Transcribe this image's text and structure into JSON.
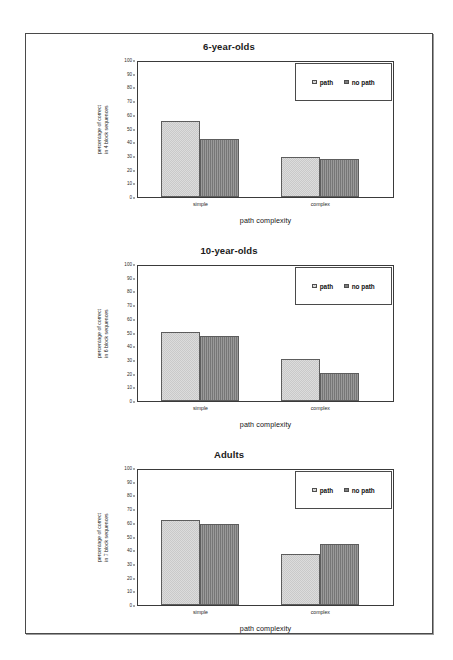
{
  "figure": {
    "panels": [
      {
        "title": "6-year-olds",
        "ylabel_line1": "percentage of correct",
        "ylabel_line2": "in 4 block sequences",
        "xlabel": "path complexity",
        "categories": [
          "simple",
          "complex"
        ],
        "yticks": [
          "0",
          "10",
          "20",
          "30",
          "40",
          "50",
          "60",
          "70",
          "80",
          "90",
          "100"
        ],
        "legend": [
          {
            "label": "path",
            "swatch": "light-checker-swatch",
            "color": "#dcdcdc"
          },
          {
            "label": "no path",
            "swatch": "dark-gray-swatch",
            "color": "#7d7d7d"
          }
        ],
        "series": [
          {
            "name": "path",
            "values": [
              56,
              30
            ]
          },
          {
            "name": "no path",
            "values": [
              43,
              28
            ]
          }
        ]
      },
      {
        "title": "10-year-olds",
        "ylabel_line1": "percentage of correct",
        "ylabel_line2": "in 6 block sequences",
        "xlabel": "path complexity",
        "categories": [
          "simple",
          "complex"
        ],
        "yticks": [
          "0",
          "10",
          "20",
          "30",
          "40",
          "50",
          "60",
          "70",
          "80",
          "90",
          "100"
        ],
        "legend": [
          {
            "label": "path",
            "swatch": "light-checker-swatch",
            "color": "#dcdcdc"
          },
          {
            "label": "no path",
            "swatch": "dark-gray-swatch",
            "color": "#7d7d7d"
          }
        ],
        "series": [
          {
            "name": "path",
            "values": [
              51,
              31
            ]
          },
          {
            "name": "no path",
            "values": [
              48,
              21
            ]
          }
        ]
      },
      {
        "title": "Adults",
        "ylabel_line1": "percentage of correct",
        "ylabel_line2": "in 7 block sequences",
        "xlabel": "path complexity",
        "categories": [
          "simple",
          "complex"
        ],
        "yticks": [
          "0",
          "10",
          "20",
          "30",
          "40",
          "50",
          "60",
          "70",
          "80",
          "90",
          "100"
        ],
        "legend": [
          {
            "label": "path",
            "swatch": "light-checker-swatch",
            "color": "#dcdcdc"
          },
          {
            "label": "no path",
            "swatch": "dark-gray-swatch",
            "color": "#7d7d7d"
          }
        ],
        "series": [
          {
            "name": "path",
            "values": [
              63,
              38
            ]
          },
          {
            "name": "no path",
            "values": [
              60,
              45
            ]
          }
        ]
      }
    ]
  },
  "chart_data": [
    {
      "type": "bar",
      "title": "6-year-olds",
      "categories": [
        "simple",
        "complex"
      ],
      "series": [
        {
          "name": "path",
          "values": [
            56,
            30
          ]
        },
        {
          "name": "no path",
          "values": [
            43,
            28
          ]
        }
      ],
      "xlabel": "path complexity",
      "ylabel": "percentage of correct in 4 block sequences",
      "ylim": [
        0,
        100
      ],
      "ytick_step": 10,
      "grid": false,
      "legend_position": "top-right-inside"
    },
    {
      "type": "bar",
      "title": "10-year-olds",
      "categories": [
        "simple",
        "complex"
      ],
      "series": [
        {
          "name": "path",
          "values": [
            51,
            31
          ]
        },
        {
          "name": "no path",
          "values": [
            48,
            21
          ]
        }
      ],
      "xlabel": "path complexity",
      "ylabel": "percentage of correct in 6 block sequences",
      "ylim": [
        0,
        100
      ],
      "ytick_step": 10,
      "grid": false,
      "legend_position": "top-right-inside"
    },
    {
      "type": "bar",
      "title": "Adults",
      "categories": [
        "simple",
        "complex"
      ],
      "series": [
        {
          "name": "path",
          "values": [
            63,
            38
          ]
        },
        {
          "name": "no path",
          "values": [
            60,
            45
          ]
        }
      ],
      "xlabel": "path complexity",
      "ylabel": "percentage of correct in 7 block sequences",
      "ylim": [
        0,
        100
      ],
      "ytick_step": 10,
      "grid": false,
      "legend_position": "top-right-inside"
    }
  ]
}
